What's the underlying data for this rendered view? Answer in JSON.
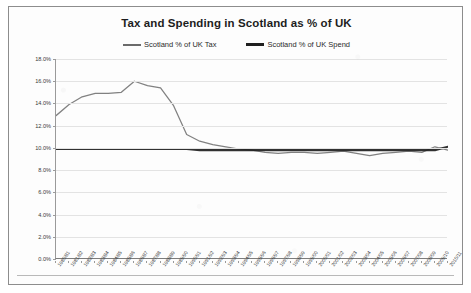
{
  "chart_data": {
    "type": "line",
    "title": "Tax and Spending in Scotland as % of UK",
    "xlabel": "",
    "ylabel": "",
    "ylim": [
      0,
      18
    ],
    "ytick_labels": [
      "0.0%",
      "2.0%",
      "4.0%",
      "6.0%",
      "8.0%",
      "10.0%",
      "12.0%",
      "14.0%",
      "16.0%",
      "18.0%"
    ],
    "ytick_values": [
      0,
      2,
      4,
      6,
      8,
      10,
      12,
      14,
      16,
      18
    ],
    "grid": true,
    "legend_position": "top-center",
    "categories": [
      "1980/81",
      "1981/82",
      "1982/83",
      "1983/84",
      "1984/85",
      "1985/86",
      "1986/87",
      "1987/88",
      "1988/89",
      "1989/90",
      "1990/91",
      "1991/92",
      "1992/93",
      "1993/94",
      "1994/95",
      "1995/96",
      "1996/97",
      "1997/98",
      "1998/99",
      "1999/00",
      "2000/01",
      "2001/02",
      "2002/03",
      "2003/04",
      "2004/05",
      "2005/06",
      "2006/07",
      "2007/08",
      "2008/09",
      "2009/10",
      "2010/11"
    ],
    "series": [
      {
        "name": "Scotland % of UK Tax",
        "color": "#6b6b6b",
        "values": [
          12.9,
          13.9,
          14.6,
          14.9,
          14.9,
          15.0,
          16.0,
          15.6,
          15.4,
          13.8,
          11.2,
          10.6,
          10.3,
          10.1,
          9.9,
          9.8,
          9.6,
          9.5,
          9.6,
          9.6,
          9.5,
          9.6,
          9.7,
          9.5,
          9.3,
          9.5,
          9.6,
          9.7,
          9.6,
          10.1,
          9.8
        ]
      },
      {
        "name": "Scotland % of UK Spend",
        "color": "#1f1f1f",
        "values": [
          9.9,
          9.9,
          9.9,
          9.9,
          9.9,
          9.9,
          9.9,
          9.9,
          9.9,
          9.9,
          9.9,
          9.8,
          9.8,
          9.8,
          9.8,
          9.8,
          9.8,
          9.8,
          9.8,
          9.8,
          9.8,
          9.8,
          9.8,
          9.8,
          9.8,
          9.8,
          9.8,
          9.8,
          9.8,
          9.8,
          10.1
        ]
      }
    ]
  },
  "legend": {
    "items": [
      {
        "label": "Scotland % of UK Tax"
      },
      {
        "label": "Scotland % of UK Spend"
      }
    ]
  }
}
